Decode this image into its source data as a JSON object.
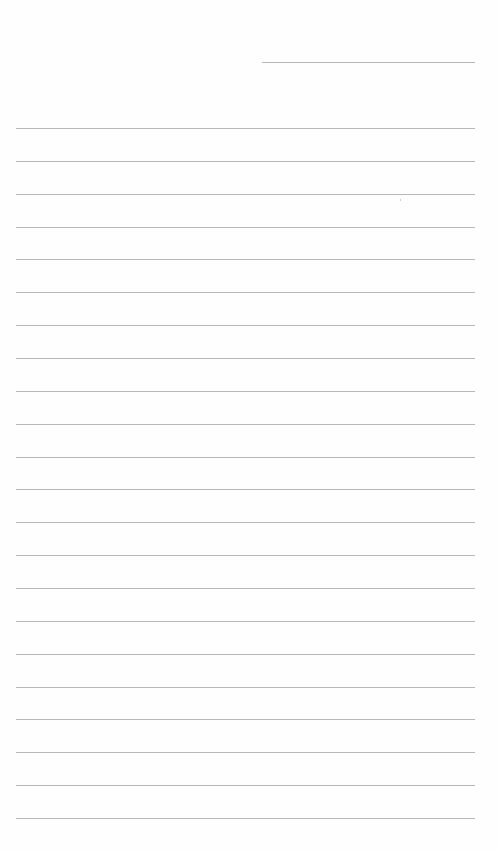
{
  "document": {
    "type": "lined-paper",
    "background_color": "#fefefe",
    "line_color": "#b8b8b8",
    "header_line": {
      "label": "name-date-line",
      "x_start": 262,
      "x_end": 475,
      "y": 62
    },
    "ruled_lines": {
      "count": 22,
      "x_start": 16,
      "x_end": 475,
      "first_y": 128,
      "spacing": 32.86
    },
    "text": []
  }
}
